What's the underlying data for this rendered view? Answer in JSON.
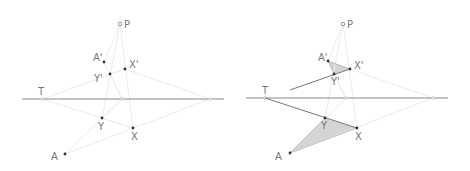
{
  "figure": {
    "panels": [
      {
        "id": "left",
        "labels": {
          "P": "P",
          "A_prime": "A'",
          "X_prime": "X'",
          "Y_prime": "Y'",
          "T": "T",
          "Y": "Y",
          "X": "X",
          "A": "A"
        }
      },
      {
        "id": "right",
        "labels": {
          "P": "P",
          "A_prime": "A'",
          "X_prime": "X'",
          "Y_prime": "Y'",
          "T": "T",
          "Y": "Y",
          "X": "X",
          "A": "A"
        }
      }
    ],
    "colors": {
      "points": "#333333",
      "labels": "#777777",
      "axis_line": "#8a8a8a",
      "construction_lines": "#ececec",
      "shaded_triangles": "#d4d4d4"
    }
  }
}
